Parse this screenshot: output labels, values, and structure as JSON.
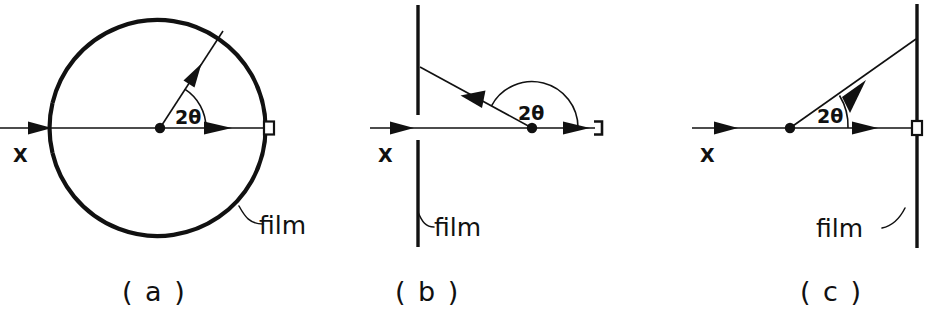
{
  "figure": {
    "background_color": "#ffffff",
    "ink_color": "#111111",
    "width": 932,
    "height": 324
  },
  "panels": [
    {
      "id": "a",
      "caption": "( a )",
      "geometry": "cylindrical-debye-scherrer",
      "beam_label": "X",
      "angle_label": "2θ",
      "film_label": "film",
      "film_shape": "circle",
      "two_theta_degrees": 57,
      "diffracted_beam_direction": "forward-upper-right"
    },
    {
      "id": "b",
      "caption": "( b )",
      "geometry": "back-reflection-flat-film",
      "beam_label": "X",
      "angle_label": "2θ",
      "film_label": "film",
      "film_shape": "vertical-line",
      "two_theta_degrees": 156,
      "diffracted_beam_direction": "back-upper-left"
    },
    {
      "id": "c",
      "caption": "( c )",
      "geometry": "transmission-flat-film",
      "beam_label": "X",
      "angle_label": "2θ",
      "film_label": "film",
      "film_shape": "vertical-line",
      "two_theta_degrees": 31,
      "diffracted_beam_direction": "forward-upper-right"
    }
  ]
}
